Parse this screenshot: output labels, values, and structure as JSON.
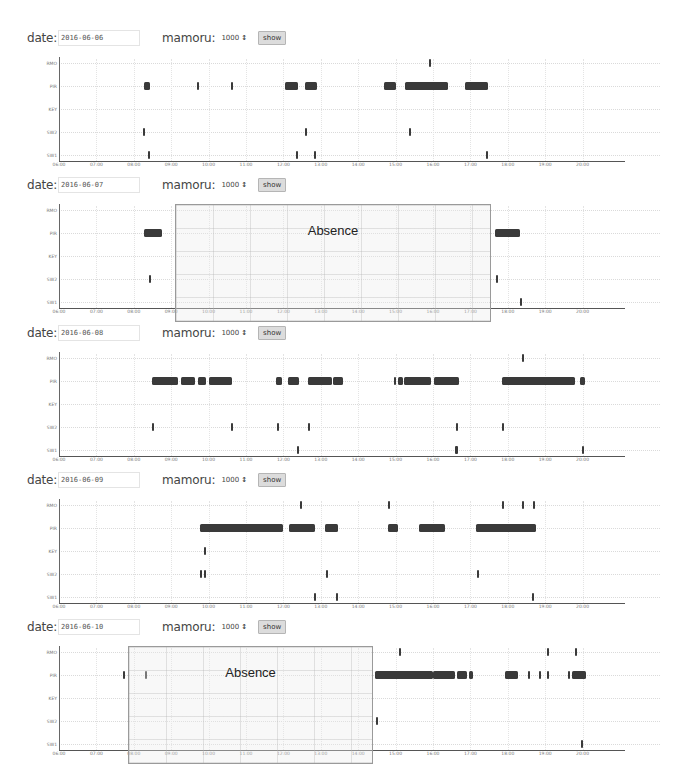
{
  "controls_labels": {
    "date_label": "date:",
    "mamoru_label": "mamoru:",
    "mamoru_value": "1000",
    "select_arrows": "↕",
    "show_button": "show"
  },
  "chart_data": [
    {
      "type": "timeline",
      "title": "date: 2016-06-06",
      "date": "2016-06-06",
      "mamoru": "1000",
      "xlabel": "",
      "ylabel": "",
      "xlim": [
        "06:00",
        "21:00"
      ],
      "x_ticks": [
        "06:00",
        "07:00",
        "08:00",
        "09:00",
        "10:00",
        "11:00",
        "12:00",
        "13:00",
        "14:00",
        "15:00",
        "16:00",
        "17:00",
        "18:00",
        "19:00",
        "20:00"
      ],
      "y_categories": [
        "RMO",
        "PIR",
        "KEY",
        "SW2",
        "SW1"
      ],
      "grid": true,
      "absence": null,
      "series": [
        {
          "name": "RMO",
          "events": [
            [
              15.9,
              15.93
            ]
          ]
        },
        {
          "name": "PIR",
          "events": [
            [
              8.27,
              8.43
            ],
            [
              9.69,
              9.73
            ],
            [
              10.62,
              10.66
            ],
            [
              12.04,
              12.39
            ],
            [
              12.58,
              12.9
            ],
            [
              14.69,
              15.01
            ],
            [
              15.25,
              16.4
            ],
            [
              16.86,
              17.47
            ]
          ]
        },
        {
          "name": "KEY",
          "events": []
        },
        {
          "name": "SW2",
          "events": [
            [
              8.27,
              8.3
            ],
            [
              12.58,
              12.61
            ],
            [
              15.38,
              15.41
            ]
          ]
        },
        {
          "name": "SW1",
          "events": [
            [
              8.38,
              8.41
            ],
            [
              12.36,
              12.39
            ],
            [
              12.82,
              12.85
            ],
            [
              17.44,
              17.47
            ]
          ]
        }
      ]
    },
    {
      "type": "timeline",
      "title": "date: 2016-06-07",
      "date": "2016-06-07",
      "mamoru": "1000",
      "xlabel": "",
      "ylabel": "",
      "xlim": [
        "06:00",
        "21:00"
      ],
      "x_ticks": [
        "06:00",
        "07:00",
        "08:00",
        "09:00",
        "10:00",
        "11:00",
        "12:00",
        "13:00",
        "14:00",
        "15:00",
        "16:00",
        "17:00",
        "18:00",
        "19:00",
        "20:00"
      ],
      "y_categories": [
        "RMO",
        "PIR",
        "KEY",
        "SW2",
        "SW1"
      ],
      "grid": true,
      "absence": {
        "label": "Absence",
        "start": 9.1,
        "end": 17.5
      },
      "series": [
        {
          "name": "RMO",
          "events": []
        },
        {
          "name": "PIR",
          "events": [
            [
              8.27,
              8.75
            ],
            [
              17.66,
              18.33
            ]
          ]
        },
        {
          "name": "KEY",
          "events": []
        },
        {
          "name": "SW2",
          "events": [
            [
              8.41,
              8.44
            ],
            [
              17.71,
              17.74
            ]
          ]
        },
        {
          "name": "SW1",
          "events": [
            [
              18.33,
              18.36
            ]
          ]
        }
      ]
    },
    {
      "type": "timeline",
      "title": "date: 2016-06-08",
      "date": "2016-06-08",
      "mamoru": "1000",
      "xlabel": "",
      "ylabel": "",
      "xlim": [
        "06:00",
        "21:00"
      ],
      "x_ticks": [
        "06:00",
        "07:00",
        "08:00",
        "09:00",
        "10:00",
        "11:00",
        "12:00",
        "13:00",
        "14:00",
        "15:00",
        "16:00",
        "17:00",
        "18:00",
        "19:00",
        "20:00"
      ],
      "y_categories": [
        "RMO",
        "PIR",
        "KEY",
        "SW2",
        "SW1"
      ],
      "grid": true,
      "absence": null,
      "series": [
        {
          "name": "RMO",
          "events": [
            [
              18.38,
              18.41
            ]
          ]
        },
        {
          "name": "PIR",
          "events": [
            [
              8.49,
              9.18
            ],
            [
              9.26,
              9.64
            ],
            [
              9.72,
              9.93
            ],
            [
              10.01,
              10.62
            ],
            [
              11.8,
              11.96
            ],
            [
              12.12,
              12.42
            ],
            [
              12.66,
              13.3
            ],
            [
              13.33,
              13.59
            ],
            [
              14.98,
              15.01
            ],
            [
              15.07,
              15.2
            ],
            [
              15.23,
              15.95
            ],
            [
              16.03,
              16.7
            ],
            [
              17.85,
              19.8
            ],
            [
              19.93,
              20.07
            ]
          ]
        },
        {
          "name": "KEY",
          "events": []
        },
        {
          "name": "SW2",
          "events": [
            [
              8.51,
              8.54
            ],
            [
              10.6,
              10.63
            ],
            [
              11.83,
              11.86
            ],
            [
              12.68,
              12.71
            ],
            [
              16.62,
              16.65
            ],
            [
              17.85,
              17.88
            ]
          ]
        },
        {
          "name": "SW1",
          "events": [
            [
              12.39,
              12.42
            ],
            [
              16.6,
              16.68
            ],
            [
              20.01,
              20.04
            ]
          ]
        }
      ]
    },
    {
      "type": "timeline",
      "title": "date: 2016-06-09",
      "date": "2016-06-09",
      "mamoru": "1000",
      "xlabel": "",
      "ylabel": "",
      "xlim": [
        "06:00",
        "21:00"
      ],
      "x_ticks": [
        "06:00",
        "07:00",
        "08:00",
        "09:00",
        "10:00",
        "11:00",
        "12:00",
        "13:00",
        "14:00",
        "15:00",
        "16:00",
        "17:00",
        "18:00",
        "19:00",
        "20:00"
      ],
      "y_categories": [
        "RMO",
        "PIR",
        "KEY",
        "SW2",
        "SW1"
      ],
      "grid": true,
      "absence": null,
      "series": [
        {
          "name": "RMO",
          "events": [
            [
              12.47,
              12.5
            ],
            [
              14.82,
              14.85
            ],
            [
              17.87,
              17.9
            ],
            [
              18.38,
              18.41
            ],
            [
              18.7,
              18.73
            ]
          ]
        },
        {
          "name": "PIR",
          "events": [
            [
              9.77,
              11.99
            ],
            [
              12.15,
              12.85
            ],
            [
              13.12,
              13.46
            ],
            [
              14.79,
              15.06
            ],
            [
              15.62,
              16.32
            ],
            [
              17.15,
              18.75
            ]
          ]
        },
        {
          "name": "KEY",
          "events": [
            [
              9.9,
              9.93
            ]
          ]
        },
        {
          "name": "SW2",
          "events": [
            [
              9.79,
              9.82
            ],
            [
              9.9,
              9.93
            ],
            [
              13.14,
              13.17
            ],
            [
              17.2,
              17.23
            ]
          ]
        },
        {
          "name": "SW1",
          "events": [
            [
              12.82,
              12.85
            ],
            [
              13.41,
              13.44
            ],
            [
              18.67,
              18.7
            ]
          ]
        }
      ]
    },
    {
      "type": "timeline",
      "title": "date: 2016-06-10",
      "date": "2016-06-10",
      "mamoru": "1000",
      "xlabel": "",
      "ylabel": "",
      "xlim": [
        "06:00",
        "21:00"
      ],
      "x_ticks": [
        "06:00",
        "07:00",
        "08:00",
        "09:00",
        "10:00",
        "11:00",
        "12:00",
        "13:00",
        "14:00",
        "15:00",
        "16:00",
        "17:00",
        "18:00",
        "19:00",
        "20:00"
      ],
      "y_categories": [
        "RMO",
        "PIR",
        "KEY",
        "SW2",
        "SW1"
      ],
      "grid": true,
      "absence": {
        "label": "Absence",
        "start": 7.85,
        "end": 14.34
      },
      "series": [
        {
          "name": "RMO",
          "events": [
            [
              15.1,
              15.15
            ],
            [
              19.07,
              19.1
            ],
            [
              19.8,
              19.83
            ]
          ]
        },
        {
          "name": "PIR",
          "events": [
            [
              7.73,
              7.78
            ],
            [
              8.31,
              8.34
            ],
            [
              14.45,
              16.0
            ],
            [
              16.0,
              16.6
            ],
            [
              16.65,
              16.9
            ],
            [
              16.96,
              17.06
            ],
            [
              17.92,
              18.27
            ],
            [
              18.56,
              18.59
            ],
            [
              18.86,
              18.89
            ],
            [
              19.07,
              19.12
            ],
            [
              19.61,
              19.64
            ],
            [
              19.72,
              20.08
            ]
          ]
        },
        {
          "name": "KEY",
          "events": []
        },
        {
          "name": "SW2",
          "events": [
            [
              14.5,
              14.53
            ]
          ]
        },
        {
          "name": "SW1",
          "events": [
            [
              19.96,
              19.99
            ]
          ]
        }
      ]
    }
  ]
}
